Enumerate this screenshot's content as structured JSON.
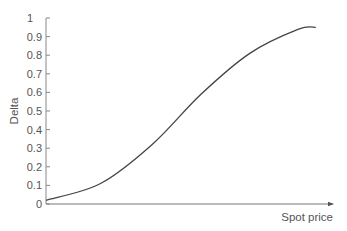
{
  "chart_data": {
    "type": "line",
    "title": "",
    "xlabel": "Spot price",
    "ylabel": "Delta",
    "ylim": [
      0,
      1
    ],
    "yticks": [
      0,
      0.1,
      0.2,
      0.3,
      0.4,
      0.5,
      0.6,
      0.7,
      0.8,
      0.9,
      1
    ],
    "ytick_labels": [
      "0",
      "0.1",
      "0.2",
      "0.3",
      "0.4",
      "0.5",
      "0.6",
      "0.7",
      "0.8",
      "0.9",
      "1"
    ],
    "xticks": [],
    "grid": false,
    "legend": null,
    "series": [
      {
        "name": "Delta",
        "x_relative": [
          0.0,
          0.19,
          0.37,
          0.54,
          0.71,
          0.88,
          0.94
        ],
        "values": [
          0.02,
          0.11,
          0.32,
          0.59,
          0.81,
          0.94,
          0.95
        ]
      }
    ],
    "colors": {
      "curve": "#444444",
      "axis": "#777777",
      "text": "#555555"
    }
  }
}
